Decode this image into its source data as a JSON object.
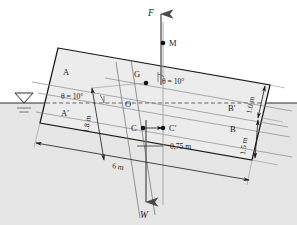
{
  "figure": {
    "type": "engineering-diagram",
    "heel_angle_label_left": "θ = 10°",
    "heel_angle_label_right": "θ = 10°"
  },
  "forces": {
    "buoyant_force": "F",
    "weight": "W"
  },
  "points": {
    "metacenter": "M",
    "center_of_gravity": "G",
    "origin": "O",
    "buoyancy_center": "C",
    "buoyancy_center_shifted": "C′",
    "corner_top_left": "A",
    "corner_waterline_left": "A′",
    "corner_waterline_right": "B′",
    "corner_bottom_right": "B"
  },
  "dimensions": {
    "width": "6 m",
    "draft": "1.5 m",
    "freeboard": "1.0 m",
    "depth_to_G": "1.8 m",
    "shift": "0,75 m"
  },
  "water": {
    "surface_symbol": "water-level-triangle",
    "fill_color": "#e3e3e3"
  },
  "colors": {
    "body_fill": "#ececec",
    "line": "#1a1a1a",
    "thin_line": "#9a9a9a",
    "dashed": "#6e6e6e"
  }
}
